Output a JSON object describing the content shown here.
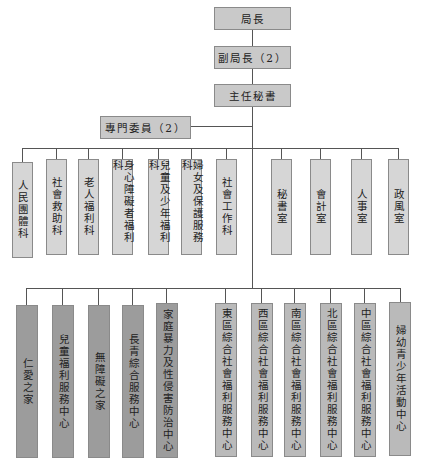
{
  "chart": {
    "top": [
      {
        "id": "director",
        "label": "局長"
      },
      {
        "id": "deputy",
        "label": "副局長（2）"
      },
      {
        "id": "chief-secretary",
        "label": "主任秘書"
      }
    ],
    "committee": {
      "label": "專門委員（2）"
    },
    "divisions": [
      {
        "label": "人民團體科"
      },
      {
        "label": "社會救助科"
      },
      {
        "label": "老人福利科"
      },
      {
        "label": "身心障礙者福利科"
      },
      {
        "label": "兒童及少年福利科"
      },
      {
        "label": "婦女及保護服務科"
      },
      {
        "label": "社會工作科"
      },
      {
        "label": "秘書室"
      },
      {
        "label": "會計室"
      },
      {
        "label": "人事室"
      },
      {
        "label": "政風室"
      }
    ],
    "units": [
      {
        "label": "仁愛之家"
      },
      {
        "label": "兒童福利服務中心"
      },
      {
        "label": "無障礙之家"
      },
      {
        "label": "長青綜合服務中心"
      },
      {
        "label": "家庭暴力及性侵害防治中心"
      },
      {
        "label": "東區綜合社會福利服務中心"
      },
      {
        "label": "西區綜合社會福利服務中心"
      },
      {
        "label": "南區綜合社會福利服務中心"
      },
      {
        "label": "北區綜合社會福利服務中心"
      },
      {
        "label": "中區綜合社會福利服務中心"
      },
      {
        "label": "婦幼青少年活動中心"
      }
    ]
  },
  "colors": {
    "top_box": "#c9c9c9",
    "division_box": "#d6d6d6",
    "unit_box_dark": "#9c9c9c",
    "unit_box_mid": "#bababa",
    "line": "#555555"
  }
}
